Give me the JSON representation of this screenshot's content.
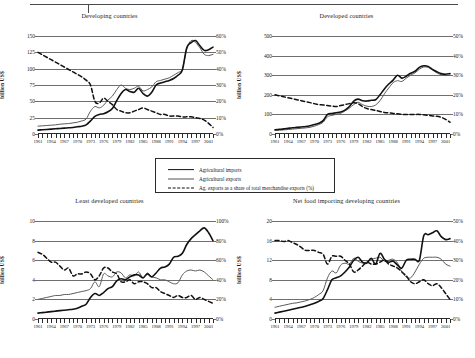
{
  "figure": {
    "legend": {
      "items": [
        {
          "label": "Agricultural imports",
          "style": "thick-solid",
          "color": "#111111"
        },
        {
          "label": "Agricultural exports",
          "style": "thin-solid",
          "color": "#555555"
        },
        {
          "label": "Ag. exports as a share of total merchandise exports (%)",
          "style": "dashed",
          "color": "#111111"
        }
      ]
    }
  },
  "chart_data": [
    {
      "type": "line",
      "title": "Developing countries",
      "xlabel": "",
      "ylabel": "billion US$",
      "ylim": [
        0,
        150
      ],
      "yticks": [
        0,
        25,
        50,
        75,
        100,
        125,
        150
      ],
      "ytick_labels": [
        "0",
        "25",
        "50",
        "75",
        "100",
        "125",
        "150"
      ],
      "y2lim": [
        0,
        60
      ],
      "y2ticks": [
        0,
        10,
        20,
        30,
        40,
        50,
        60
      ],
      "y2tick_labels": [
        "0%",
        "10%",
        "20%",
        "30%",
        "40%",
        "50%",
        "60%"
      ],
      "grid": true,
      "legend_position": "figure-center",
      "x": [
        1961,
        1962,
        1963,
        1964,
        1965,
        1966,
        1967,
        1968,
        1969,
        1970,
        1971,
        1972,
        1973,
        1974,
        1975,
        1976,
        1977,
        1978,
        1979,
        1980,
        1981,
        1982,
        1983,
        1984,
        1985,
        1986,
        1987,
        1988,
        1989,
        1990,
        1991,
        1992,
        1993,
        1994,
        1995,
        1996,
        1997,
        1998,
        1999,
        2000,
        2001
      ],
      "xtick_labels": [
        "1961",
        "1964",
        "1967",
        "1970",
        "1973",
        "1976",
        "1979",
        "1982",
        "1985",
        "1988",
        "1991",
        "1994",
        "1997",
        "2001"
      ],
      "series": [
        {
          "name": "Agricultural imports",
          "axis": "left",
          "values": [
            6,
            6.5,
            7,
            7.5,
            8,
            8.5,
            9,
            9.5,
            10,
            11,
            12,
            14,
            20,
            27,
            30,
            31,
            34,
            39,
            51,
            62,
            68,
            65,
            64,
            70,
            62,
            58,
            64,
            75,
            78,
            80,
            82,
            85,
            90,
            98,
            132,
            140,
            143,
            135,
            128,
            129,
            133
          ]
        },
        {
          "name": "Agricultural exports",
          "axis": "left",
          "values": [
            12,
            12.5,
            13,
            13.5,
            14,
            15,
            15.5,
            16,
            17,
            18,
            20,
            23,
            35,
            42,
            40,
            44,
            52,
            58,
            68,
            75,
            70,
            68,
            70,
            73,
            66,
            68,
            72,
            80,
            82,
            84,
            86,
            90,
            94,
            100,
            130,
            143,
            140,
            132,
            122,
            120,
            122
          ]
        },
        {
          "name": "Ag. exports as a share of total merchandise exports (%)",
          "axis": "right",
          "values": [
            50,
            48.5,
            47,
            45.5,
            44,
            42.5,
            41,
            39.5,
            38,
            36.5,
            35,
            33,
            30,
            20,
            19,
            22,
            20,
            18,
            15,
            14,
            13,
            13,
            14,
            15,
            16,
            15,
            14,
            13,
            12,
            12,
            11,
            11,
            11,
            10.5,
            10.5,
            10.5,
            10,
            9.5,
            8.5,
            6.5,
            4
          ]
        }
      ]
    },
    {
      "type": "line",
      "title": "Developed countries",
      "xlabel": "",
      "ylabel": "billion US$",
      "ylim": [
        0,
        500
      ],
      "yticks": [
        0,
        100,
        200,
        300,
        400,
        500
      ],
      "ytick_labels": [
        "0",
        "100",
        "200",
        "300",
        "400",
        "500"
      ],
      "y2lim": [
        0,
        50
      ],
      "y2ticks": [
        0,
        10,
        20,
        30,
        40,
        50
      ],
      "y2tick_labels": [
        "0%",
        "10%",
        "20%",
        "30%",
        "40%",
        "50%"
      ],
      "grid": true,
      "legend_position": "figure-center",
      "x": [
        1961,
        1962,
        1963,
        1964,
        1965,
        1966,
        1967,
        1968,
        1969,
        1970,
        1971,
        1972,
        1973,
        1974,
        1975,
        1976,
        1977,
        1978,
        1979,
        1980,
        1981,
        1982,
        1983,
        1984,
        1985,
        1986,
        1987,
        1988,
        1989,
        1990,
        1991,
        1992,
        1993,
        1994,
        1995,
        1996,
        1997,
        1998,
        1999,
        2000,
        2001
      ],
      "xtick_labels": [
        "1961",
        "1964",
        "1967",
        "1970",
        "1973",
        "1976",
        "1979",
        "1982",
        "1985",
        "1988",
        "1991",
        "1994",
        "1997",
        "2001"
      ],
      "series": [
        {
          "name": "Agricultural imports",
          "axis": "left",
          "values": [
            22,
            24,
            26,
            29,
            32,
            34,
            36,
            38,
            42,
            48,
            55,
            68,
            100,
            105,
            108,
            112,
            122,
            140,
            168,
            178,
            170,
            168,
            172,
            175,
            200,
            230,
            255,
            275,
            300,
            285,
            295,
            310,
            320,
            340,
            348,
            345,
            330,
            318,
            308,
            305,
            308
          ]
        },
        {
          "name": "Agricultural exports",
          "axis": "left",
          "values": [
            18,
            19,
            21,
            23,
            25,
            27,
            29,
            31,
            34,
            40,
            48,
            60,
            88,
            95,
            100,
            105,
            118,
            132,
            150,
            162,
            150,
            142,
            140,
            148,
            170,
            205,
            235,
            262,
            272,
            268,
            285,
            300,
            312,
            330,
            342,
            340,
            326,
            312,
            302,
            298,
            300
          ]
        },
        {
          "name": "Ag. exports as a share of total merchandise exports (%)",
          "axis": "right",
          "values": [
            20,
            19.5,
            19,
            18.5,
            18,
            17.5,
            17,
            16.5,
            16,
            15.5,
            15,
            14.8,
            14.5,
            14.2,
            14,
            14.5,
            15,
            15.5,
            16,
            15.5,
            14,
            13,
            12.5,
            12,
            11.5,
            11,
            10.8,
            10.5,
            10.3,
            10,
            10,
            10,
            10,
            10,
            9.8,
            9.5,
            9.2,
            9,
            8.5,
            7.5,
            6
          ]
        }
      ]
    },
    {
      "type": "line",
      "title": "Least developed countries",
      "xlabel": "",
      "ylabel": "billion US$",
      "ylim": [
        0,
        10
      ],
      "yticks": [
        0,
        2,
        4,
        6,
        8,
        10
      ],
      "ytick_labels": [
        "0",
        "2",
        "4",
        "6",
        "8",
        "10"
      ],
      "y2lim": [
        0,
        100
      ],
      "y2ticks": [
        0,
        20,
        40,
        60,
        80,
        100
      ],
      "y2tick_labels": [
        "0%",
        "20%",
        "40%",
        "60%",
        "80%",
        "100%"
      ],
      "grid": true,
      "legend_position": "figure-center",
      "x": [
        1961,
        1962,
        1963,
        1964,
        1965,
        1966,
        1967,
        1968,
        1969,
        1970,
        1971,
        1972,
        1973,
        1974,
        1975,
        1976,
        1977,
        1978,
        1979,
        1980,
        1981,
        1982,
        1983,
        1984,
        1985,
        1986,
        1987,
        1988,
        1989,
        1990,
        1991,
        1992,
        1993,
        1994,
        1995,
        1996,
        1997,
        1998,
        1999,
        2000,
        2001
      ],
      "xtick_labels": [
        "1961",
        "1964",
        "1967",
        "1970",
        "1973",
        "1976",
        "1979",
        "1982",
        "1985",
        "1988",
        "1991",
        "1994",
        "1997",
        "2001"
      ],
      "series": [
        {
          "name": "Agricultural imports",
          "axis": "left",
          "values": [
            0.6,
            0.65,
            0.7,
            0.75,
            0.8,
            0.85,
            0.9,
            0.95,
            1.0,
            1.1,
            1.3,
            1.5,
            2.2,
            2.6,
            2.4,
            2.7,
            3.1,
            3.3,
            3.9,
            4.1,
            4.0,
            4.3,
            4.5,
            4.5,
            4.2,
            4.6,
            4.3,
            4.7,
            5.2,
            5.3,
            5.6,
            6.3,
            6.4,
            6.7,
            7.6,
            8.2,
            8.6,
            9.0,
            9.3,
            8.8,
            8.0
          ]
        },
        {
          "name": "Agricultural exports",
          "axis": "left",
          "values": [
            2.0,
            2.1,
            2.2,
            2.3,
            2.4,
            2.4,
            2.5,
            2.5,
            2.6,
            2.7,
            2.8,
            2.9,
            3.1,
            3.8,
            3.3,
            4.6,
            4.4,
            4.3,
            4.8,
            4.7,
            4.2,
            4.5,
            4.4,
            4.8,
            4.2,
            4.7,
            4.3,
            4.2,
            4.0,
            4.0,
            3.8,
            3.6,
            3.7,
            4.5,
            4.9,
            5.0,
            4.9,
            5.0,
            4.8,
            4.4,
            4.0
          ]
        },
        {
          "name": "Ag. exports as a share of total merchandise exports (%)",
          "axis": "right",
          "values": [
            68,
            66,
            62,
            58,
            58,
            54,
            50,
            52,
            44,
            46,
            46,
            48,
            46,
            40,
            44,
            52,
            52,
            48,
            46,
            38,
            38,
            40,
            36,
            38,
            38,
            36,
            32,
            32,
            28,
            26,
            24,
            22,
            24,
            22,
            22,
            24,
            20,
            22,
            20,
            18,
            16
          ]
        }
      ]
    },
    {
      "type": "line",
      "title": "Net food importing developing countries",
      "xlabel": "",
      "ylabel": "billion US$",
      "ylim": [
        0,
        20
      ],
      "yticks": [
        0,
        4,
        8,
        12,
        16,
        20
      ],
      "ytick_labels": [
        "0",
        "4",
        "8",
        "12",
        "16",
        "20"
      ],
      "y2lim": [
        0,
        50
      ],
      "y2ticks": [
        0,
        10,
        20,
        30,
        40,
        50
      ],
      "y2tick_labels": [
        "0%",
        "10%",
        "20%",
        "30%",
        "40%",
        "50%"
      ],
      "grid": true,
      "legend_position": "figure-center",
      "x": [
        1961,
        1962,
        1963,
        1964,
        1965,
        1966,
        1967,
        1968,
        1969,
        1970,
        1971,
        1972,
        1973,
        1974,
        1975,
        1976,
        1977,
        1978,
        1979,
        1980,
        1981,
        1982,
        1983,
        1984,
        1985,
        1986,
        1987,
        1988,
        1989,
        1990,
        1991,
        1992,
        1993,
        1994,
        1995,
        1996,
        1997,
        1998,
        1999,
        2000,
        2001
      ],
      "xtick_labels": [
        "1961",
        "1964",
        "1967",
        "1970",
        "1973",
        "1976",
        "1979",
        "1982",
        "1985",
        "1988",
        "1991",
        "1994",
        "1997",
        "2001"
      ],
      "series": [
        {
          "name": "Agricultural imports",
          "axis": "left",
          "values": [
            1.2,
            1.4,
            1.6,
            1.8,
            2.0,
            2.2,
            2.4,
            2.6,
            2.9,
            3.2,
            3.6,
            4.2,
            6.0,
            8.0,
            8.4,
            8.8,
            9.6,
            10.6,
            12.0,
            12.6,
            11.6,
            11.4,
            12.4,
            11.2,
            13.4,
            12.2,
            11.6,
            11.8,
            11.0,
            10.4,
            12.0,
            12.2,
            12.2,
            12.0,
            17.0,
            17.2,
            17.6,
            18.0,
            16.8,
            16.2,
            16.4
          ]
        },
        {
          "name": "Agricultural exports",
          "axis": "left",
          "values": [
            2.4,
            2.6,
            2.8,
            3.0,
            3.2,
            3.3,
            3.5,
            3.7,
            4.0,
            4.4,
            5.0,
            5.8,
            8.4,
            9.8,
            9.4,
            11.0,
            11.4,
            11.2,
            12.4,
            11.8,
            11.4,
            11.6,
            12.2,
            12.4,
            12.6,
            11.8,
            12.0,
            12.2,
            11.4,
            9.6,
            8.6,
            8.4,
            9.6,
            11.2,
            12.4,
            12.6,
            12.6,
            12.6,
            12.2,
            11.2,
            10.8
          ]
        },
        {
          "name": "Ag. exports as a share of total merchandise exports (%)",
          "axis": "right",
          "values": [
            40,
            40,
            39.5,
            40,
            39,
            38,
            36.5,
            35,
            35,
            35,
            34,
            33,
            28,
            32,
            32,
            32,
            30,
            28,
            24,
            25,
            27,
            29,
            28,
            28,
            29,
            30,
            28,
            27,
            26,
            24,
            22,
            19,
            18,
            19,
            20,
            18,
            17,
            18,
            16,
            13,
            10
          ]
        }
      ]
    }
  ]
}
